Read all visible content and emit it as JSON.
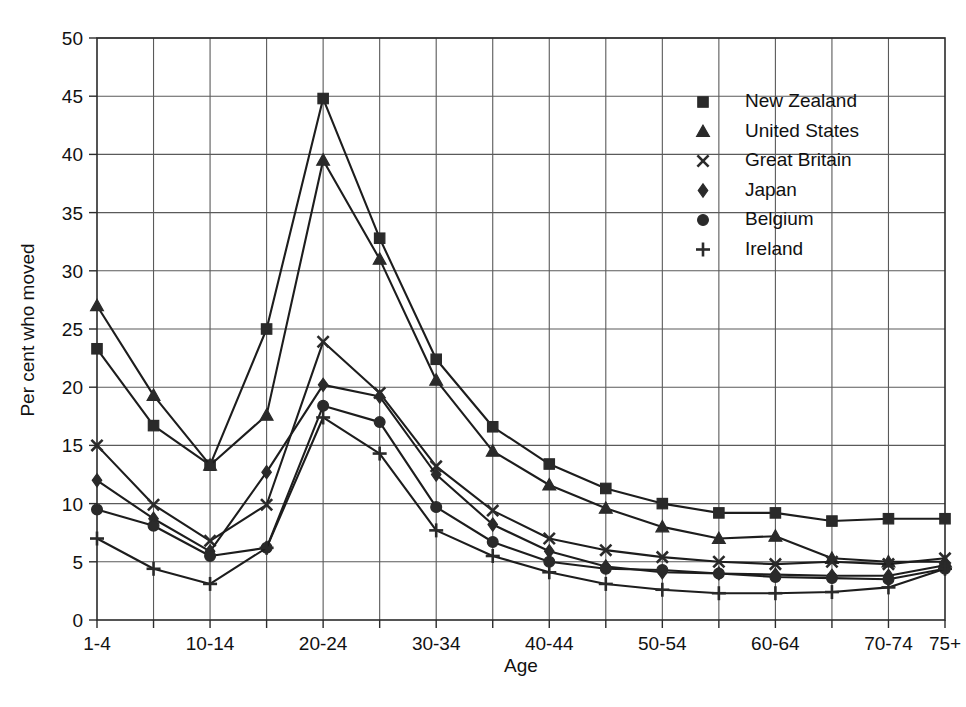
{
  "chart_data": {
    "type": "line",
    "title": "",
    "xlabel": "Age",
    "ylabel": "Per cent who moved",
    "ylim": [
      0,
      50
    ],
    "yticks": [
      0,
      5,
      10,
      15,
      20,
      25,
      30,
      35,
      40,
      45,
      50
    ],
    "ytick_labels": [
      "0",
      "5",
      "10",
      "15",
      "20",
      "25",
      "30",
      "35",
      "40",
      "45",
      "50"
    ],
    "grid": true,
    "legend_position": "top-right",
    "categories": [
      "1-4",
      "5-9",
      "10-14",
      "15-19",
      "20-24",
      "25-29",
      "30-34",
      "35-39",
      "40-44",
      "45-49",
      "50-54",
      "55-59",
      "60-64",
      "65-69",
      "70-74",
      "75+"
    ],
    "xtick_labels": [
      "1-4",
      "",
      "10-14",
      "",
      "20-24",
      "",
      "30-34",
      "",
      "40-44",
      "",
      "50-54",
      "",
      "60-64",
      "",
      "70-74",
      "75+"
    ],
    "series": [
      {
        "name": "New Zealand",
        "marker": "square",
        "values": [
          23.3,
          16.7,
          13.3,
          25.0,
          44.8,
          32.8,
          22.4,
          16.6,
          13.4,
          11.3,
          10.0,
          9.2,
          9.2,
          8.5,
          8.7,
          8.7
        ]
      },
      {
        "name": "United States",
        "marker": "triangle",
        "values": [
          27.0,
          19.3,
          13.3,
          17.6,
          39.5,
          31.0,
          20.6,
          14.5,
          11.6,
          9.6,
          8.0,
          7.0,
          7.2,
          5.3,
          5.0,
          5.0
        ]
      },
      {
        "name": "Great Britain",
        "marker": "cross",
        "values": [
          15.0,
          9.9,
          6.8,
          9.9,
          23.9,
          19.5,
          13.2,
          9.4,
          7.0,
          6.0,
          5.4,
          5.0,
          4.8,
          5.0,
          4.8,
          5.3
        ]
      },
      {
        "name": "Japan",
        "marker": "diamond",
        "values": [
          12.0,
          8.7,
          5.9,
          12.7,
          20.2,
          19.2,
          12.5,
          8.2,
          5.9,
          4.6,
          4.1,
          4.0,
          3.9,
          3.8,
          3.8,
          4.7
        ]
      },
      {
        "name": "Belgium",
        "marker": "circle",
        "values": [
          9.5,
          8.1,
          5.5,
          6.2,
          18.4,
          17.0,
          9.7,
          6.7,
          5.0,
          4.4,
          4.3,
          4.0,
          3.7,
          3.6,
          3.5,
          4.4
        ]
      },
      {
        "name": "Ireland",
        "marker": "plus",
        "values": [
          7.0,
          4.4,
          3.1,
          6.2,
          17.4,
          14.3,
          7.7,
          5.5,
          4.1,
          3.1,
          2.6,
          2.3,
          2.3,
          2.4,
          2.8,
          4.4
        ]
      }
    ],
    "colors": {
      "series_stroke": "#1d1d1d",
      "marker_fill": "#2a2a2a",
      "grid": "#5a5a5a",
      "axis": "#2b2b2b",
      "background": "#ffffff"
    }
  },
  "legend": {
    "items": [
      {
        "label": "New Zealand",
        "marker": "square"
      },
      {
        "label": "United States",
        "marker": "triangle"
      },
      {
        "label": "Great Britain",
        "marker": "cross"
      },
      {
        "label": "Japan",
        "marker": "diamond"
      },
      {
        "label": "Belgium",
        "marker": "circle"
      },
      {
        "label": "Ireland",
        "marker": "plus"
      }
    ]
  }
}
